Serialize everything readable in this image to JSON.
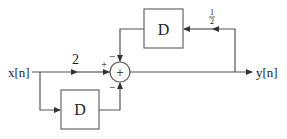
{
  "diagram": {
    "type": "block-diagram",
    "input_label": "x[n]",
    "output_label": "y[n]",
    "blocks": [
      {
        "id": "delay-top",
        "label": "D"
      },
      {
        "id": "delay-bottom",
        "label": "D"
      }
    ],
    "adder": {
      "symbol": "+",
      "inputs": [
        {
          "from": "input-gain",
          "sign": "+"
        },
        {
          "from": "delay-top",
          "sign": "−"
        },
        {
          "from": "delay-bottom",
          "sign": "−"
        }
      ]
    },
    "gains": {
      "forward": "2",
      "feedback_num": "1",
      "feedback_den": "2"
    }
  },
  "colors": {
    "line": "#555555",
    "box": "#666666"
  }
}
